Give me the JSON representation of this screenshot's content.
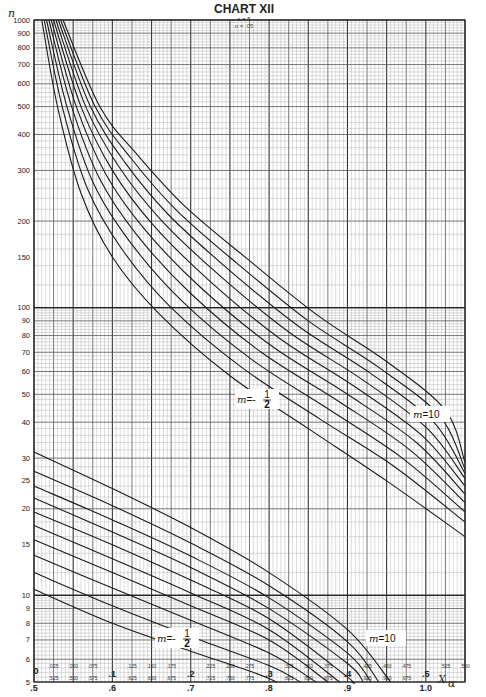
{
  "chart_data": {
    "type": "line",
    "title": "CHART XII",
    "subtitle_lines": [
      "s = 5",
      "α = .05"
    ],
    "ylabel": "n",
    "xlabel": "X",
    "xlabel_subscript": "α",
    "yscale": "log",
    "ylim": [
      5,
      1000
    ],
    "xlim": [
      0,
      0.55
    ],
    "grid": true,
    "yticks": [
      5,
      6,
      7,
      8,
      9,
      10,
      15,
      20,
      25,
      30,
      40,
      50,
      60,
      70,
      80,
      90,
      100,
      150,
      200,
      300,
      400,
      500,
      600,
      700,
      800,
      900,
      1000
    ],
    "ytick_labels": [
      "5",
      "6",
      "7",
      "8",
      "9",
      "10",
      "15",
      "20",
      "25",
      "30",
      "40",
      "50",
      "60",
      "70",
      "80",
      "90",
      "100",
      "150",
      "200",
      "300",
      "400",
      "500",
      "600",
      "700",
      "800",
      "900",
      "1000"
    ],
    "xticks_upper_minor": [
      0.025,
      0.05,
      0.075,
      0.125,
      0.15,
      0.175,
      0.225,
      0.25,
      0.275,
      0.325,
      0.35,
      0.375,
      0.425,
      0.45,
      0.475,
      0.525,
      0.55
    ],
    "xticks_upper_minor_labels": [
      ".025",
      ".050",
      ".075",
      ".125",
      ".150",
      ".175",
      ".225",
      ".250",
      ".275",
      ".325",
      ".350",
      ".375",
      ".425",
      ".450",
      ".475",
      ".525",
      ".550"
    ],
    "xticks_upper_major": [
      0,
      0.1,
      0.2,
      0.3,
      0.4,
      0.5
    ],
    "xticks_upper_major_labels": [
      "0",
      ".1",
      ".2",
      ".3",
      ".4",
      ".5"
    ],
    "xticks_lower_minor": [
      0.525,
      0.55,
      0.575,
      0.625,
      0.65,
      0.675,
      0.725,
      0.75,
      0.775,
      0.825,
      0.85,
      0.875,
      0.925,
      0.95,
      0.975
    ],
    "xticks_lower_minor_labels": [
      ".525",
      ".550",
      ".575",
      ".625",
      ".650",
      ".675",
      ".725",
      ".750",
      ".775",
      ".825",
      ".850",
      ".875",
      ".925",
      ".950",
      ".975"
    ],
    "xticks_lower_major": [
      0.5,
      0.6,
      0.7,
      0.8,
      0.9,
      1.0
    ],
    "xticks_lower_major_labels": [
      ".5",
      ".6",
      ".7",
      ".8",
      ".9",
      "1.0"
    ],
    "families": [
      {
        "name": "upper",
        "x_scale": "upper (0 to .55)",
        "label_left": {
          "text": "m = -",
          "frac_num": "1",
          "frac_den": "2"
        },
        "label_right": {
          "text": "m = 10"
        },
        "series": [
          {
            "name": "m=-1/2",
            "points": [
              [
                0.01,
                1000
              ],
              [
                0.03,
                500
              ],
              [
                0.06,
                250
              ],
              [
                0.1,
                150
              ],
              [
                0.16,
                95
              ],
              [
                0.25,
                58
              ],
              [
                0.35,
                38
              ],
              [
                0.45,
                25
              ],
              [
                0.55,
                16
              ]
            ]
          },
          {
            "name": "m=0",
            "points": [
              [
                0.013,
                1000
              ],
              [
                0.036,
                500
              ],
              [
                0.068,
                260
              ],
              [
                0.112,
                160
              ],
              [
                0.175,
                100
              ],
              [
                0.265,
                62
              ],
              [
                0.365,
                41
              ],
              [
                0.46,
                28
              ],
              [
                0.55,
                18
              ]
            ]
          },
          {
            "name": "m=1/2",
            "points": [
              [
                0.016,
                1000
              ],
              [
                0.042,
                500
              ],
              [
                0.076,
                270
              ],
              [
                0.122,
                170
              ],
              [
                0.188,
                106
              ],
              [
                0.278,
                66
              ],
              [
                0.378,
                44
              ],
              [
                0.47,
                30
              ],
              [
                0.55,
                19.5
              ]
            ]
          },
          {
            "name": "m=1",
            "points": [
              [
                0.019,
                1000
              ],
              [
                0.048,
                500
              ],
              [
                0.084,
                280
              ],
              [
                0.132,
                178
              ],
              [
                0.2,
                112
              ],
              [
                0.29,
                70
              ],
              [
                0.39,
                47
              ],
              [
                0.48,
                32
              ],
              [
                0.55,
                21
              ]
            ]
          },
          {
            "name": "m=2",
            "points": [
              [
                0.022,
                1000
              ],
              [
                0.054,
                500
              ],
              [
                0.092,
                290
              ],
              [
                0.142,
                186
              ],
              [
                0.212,
                118
              ],
              [
                0.302,
                74
              ],
              [
                0.4,
                50
              ],
              [
                0.488,
                34
              ],
              [
                0.55,
                22.5
              ]
            ]
          },
          {
            "name": "m=3",
            "points": [
              [
                0.025,
                1000
              ],
              [
                0.06,
                500
              ],
              [
                0.1,
                300
              ],
              [
                0.152,
                194
              ],
              [
                0.224,
                124
              ],
              [
                0.314,
                78
              ],
              [
                0.41,
                53
              ],
              [
                0.495,
                36
              ],
              [
                0.55,
                24
              ]
            ]
          },
          {
            "name": "m=4",
            "points": [
              [
                0.028,
                1000
              ],
              [
                0.066,
                500
              ],
              [
                0.108,
                310
              ],
              [
                0.162,
                202
              ],
              [
                0.236,
                130
              ],
              [
                0.326,
                82
              ],
              [
                0.42,
                56
              ],
              [
                0.502,
                38
              ],
              [
                0.55,
                25.5
              ]
            ]
          },
          {
            "name": "m=5",
            "points": [
              [
                0.031,
                1000
              ],
              [
                0.072,
                500
              ],
              [
                0.116,
                320
              ],
              [
                0.172,
                210
              ],
              [
                0.248,
                136
              ],
              [
                0.338,
                86
              ],
              [
                0.43,
                59
              ],
              [
                0.51,
                40
              ],
              [
                0.55,
                26.5
              ]
            ]
          },
          {
            "name": "m=7",
            "points": [
              [
                0.034,
                1000
              ],
              [
                0.078,
                500
              ],
              [
                0.124,
                330
              ],
              [
                0.182,
                218
              ],
              [
                0.26,
                142
              ],
              [
                0.35,
                90
              ],
              [
                0.44,
                62
              ],
              [
                0.518,
                42
              ],
              [
                0.55,
                27.5
              ]
            ]
          },
          {
            "name": "m=10",
            "points": [
              [
                0.037,
                1000
              ],
              [
                0.084,
                500
              ],
              [
                0.132,
                340
              ],
              [
                0.192,
                226
              ],
              [
                0.272,
                148
              ],
              [
                0.362,
                94
              ],
              [
                0.45,
                65
              ],
              [
                0.525,
                44
              ],
              [
                0.55,
                29
              ]
            ]
          }
        ]
      },
      {
        "name": "lower",
        "x_scale": "lower (.5 to 1.05)",
        "label_left": {
          "text": "m = -",
          "frac_num": "1",
          "frac_den": "2"
        },
        "label_right": {
          "text": "m = 10"
        },
        "series": [
          {
            "name": "m=-1/2",
            "points": [
              [
                0.5,
                10.5
              ],
              [
                0.6,
                8.0
              ],
              [
                0.7,
                6.4
              ],
              [
                0.78,
                5.4
              ],
              [
                0.81,
                5.0
              ]
            ]
          },
          {
            "name": "m=0",
            "points": [
              [
                0.5,
                12.0
              ],
              [
                0.6,
                9.2
              ],
              [
                0.7,
                7.2
              ],
              [
                0.8,
                5.7
              ],
              [
                0.84,
                5.0
              ]
            ]
          },
          {
            "name": "m=1/2",
            "points": [
              [
                0.5,
                13.8
              ],
              [
                0.6,
                10.6
              ],
              [
                0.7,
                8.2
              ],
              [
                0.8,
                6.3
              ],
              [
                0.86,
                5.0
              ]
            ]
          },
          {
            "name": "m=1",
            "points": [
              [
                0.5,
                15.6
              ],
              [
                0.6,
                12.0
              ],
              [
                0.7,
                9.2
              ],
              [
                0.8,
                7.0
              ],
              [
                0.875,
                5.0
              ]
            ]
          },
          {
            "name": "m=2",
            "points": [
              [
                0.5,
                17.5
              ],
              [
                0.6,
                13.4
              ],
              [
                0.7,
                10.2
              ],
              [
                0.8,
                7.6
              ],
              [
                0.89,
                5.0
              ]
            ]
          },
          {
            "name": "m=3",
            "points": [
              [
                0.5,
                19.5
              ],
              [
                0.6,
                15.0
              ],
              [
                0.7,
                11.3
              ],
              [
                0.8,
                8.3
              ],
              [
                0.9,
                5.2
              ],
              [
                0.905,
                5.0
              ]
            ]
          },
          {
            "name": "m=4",
            "points": [
              [
                0.5,
                21.8
              ],
              [
                0.6,
                16.6
              ],
              [
                0.7,
                12.5
              ],
              [
                0.8,
                9.0
              ],
              [
                0.9,
                5.8
              ],
              [
                0.92,
                5.0
              ]
            ]
          },
          {
            "name": "m=5",
            "points": [
              [
                0.5,
                24.0
              ],
              [
                0.6,
                18.3
              ],
              [
                0.7,
                13.7
              ],
              [
                0.8,
                9.8
              ],
              [
                0.9,
                6.3
              ],
              [
                0.93,
                5.0
              ]
            ]
          },
          {
            "name": "m=7",
            "points": [
              [
                0.5,
                27.0
              ],
              [
                0.6,
                20.5
              ],
              [
                0.7,
                15.2
              ],
              [
                0.8,
                10.8
              ],
              [
                0.9,
                6.9
              ],
              [
                0.94,
                5.0
              ]
            ]
          },
          {
            "name": "m=10",
            "points": [
              [
                0.5,
                31.5
              ],
              [
                0.6,
                23.5
              ],
              [
                0.7,
                17.2
              ],
              [
                0.8,
                12.0
              ],
              [
                0.9,
                7.6
              ],
              [
                0.955,
                5.0
              ]
            ]
          }
        ]
      }
    ]
  }
}
